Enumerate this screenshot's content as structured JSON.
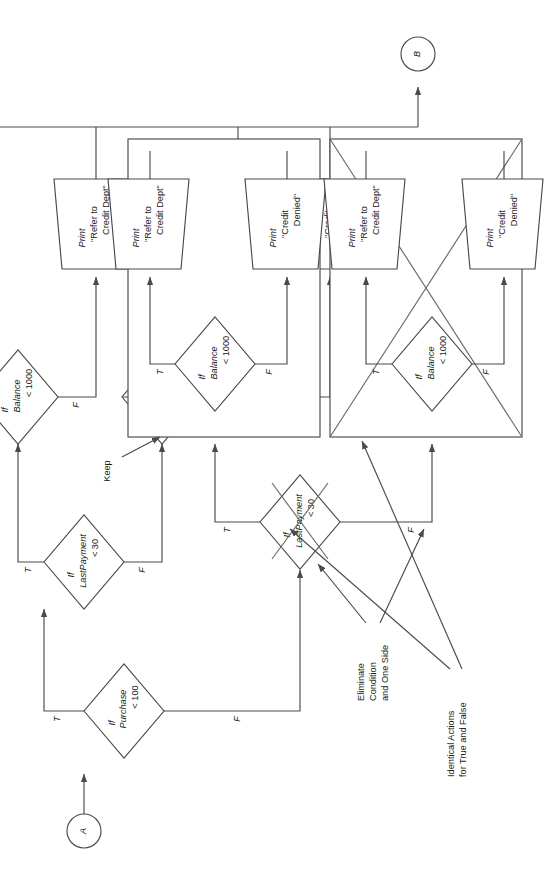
{
  "diagram": {
    "rotation_degrees": -90,
    "stroke_color": "#4a4a4a",
    "text_color": "#1a1a1a",
    "background": "#ffffff"
  },
  "connectors": {
    "entry": "A",
    "exit": "B"
  },
  "decisions": {
    "purchase": {
      "line1": "If",
      "line2": "Purchase",
      "line3": "< 100"
    },
    "lastpayment": {
      "line1": "If",
      "line2": "LastPayment",
      "line3": "< 30"
    },
    "balance": {
      "line1": "If",
      "line2": "Balance",
      "line3": "< 1000"
    }
  },
  "processes": {
    "credit_ok": {
      "line1": "Print",
      "line2": "\"Credit",
      "line3": "Ok\""
    },
    "refer": {
      "line1": "Print",
      "line2": "\"Refer to",
      "line3": "Credit Dept\""
    },
    "denied": {
      "line1": "Print",
      "line2": "\"Credit",
      "line3": "Denied\""
    }
  },
  "branch_labels": {
    "true": "T",
    "false": "F"
  },
  "annotations": {
    "keep": "Keep",
    "identical_actions": {
      "line1": "Identical Actions",
      "line2": "for True and False"
    },
    "eliminate": {
      "line1": "Eliminate",
      "line2": "Condition",
      "line3": "and One Side"
    }
  },
  "branches": [
    {
      "id": "branch-true-lastpayment-true",
      "decision": "lastpayment",
      "path": "T",
      "balance_true_action": "credit_ok",
      "balance_false_action": "refer",
      "struck_out": false
    },
    {
      "id": "branch-true-lastpayment-false",
      "decision": "lastpayment",
      "path": "F",
      "balance_true_action": "credit_ok",
      "balance_false_action": "denied",
      "struck_out": false
    },
    {
      "id": "branch-false-lastpayment-true",
      "decision": "lastpayment",
      "path": "T",
      "balance_true_action": "refer",
      "balance_false_action": "denied",
      "struck_out": false,
      "grouped": true
    },
    {
      "id": "branch-false-lastpayment-false",
      "decision": "lastpayment",
      "path": "F",
      "balance_true_action": "refer",
      "balance_false_action": "denied",
      "struck_out": true,
      "grouped": true
    }
  ]
}
